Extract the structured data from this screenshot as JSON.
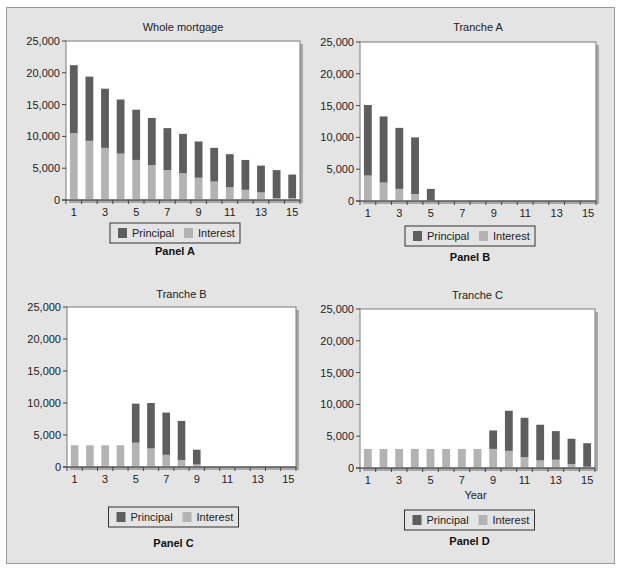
{
  "colors": {
    "principal": "#5e5e5e",
    "interest": "#b3b3b3",
    "plot_bg": "#ffffff",
    "frame_bg": "#e4e4e4"
  },
  "legend": {
    "principal": "Principal",
    "interest": "Interest"
  },
  "chart_data": [
    {
      "type": "bar",
      "stacked": true,
      "title": "Whole mortgage",
      "panel": "Panel A",
      "xlabel": "",
      "ylabel": "",
      "ylim": [
        0,
        25000
      ],
      "yticks": [
        "0",
        "5,000",
        "10,000",
        "15,000",
        "20,000",
        "25,000"
      ],
      "xticks": [
        "1",
        "3",
        "5",
        "7",
        "9",
        "11",
        "13",
        "15"
      ],
      "categories": [
        1,
        2,
        3,
        4,
        5,
        6,
        7,
        8,
        9,
        10,
        11,
        12,
        13,
        14,
        15
      ],
      "legend_position": "bottom",
      "series": [
        {
          "name": "Interest",
          "values": [
            10500,
            9300,
            8200,
            7300,
            6300,
            5500,
            4700,
            4200,
            3500,
            2900,
            2000,
            1600,
            1200,
            300,
            300
          ]
        },
        {
          "name": "Principal",
          "values": [
            10700,
            10100,
            9300,
            8500,
            7900,
            7400,
            6600,
            6200,
            5700,
            5300,
            5200,
            4700,
            4200,
            4400,
            3700
          ]
        }
      ]
    },
    {
      "type": "bar",
      "stacked": true,
      "title": "Tranche A",
      "panel": "Panel B",
      "xlabel": "",
      "ylabel": "",
      "ylim": [
        0,
        25000
      ],
      "yticks": [
        "0",
        "5,000",
        "10,000",
        "15,000",
        "20,000",
        "25,000"
      ],
      "xticks": [
        "1",
        "3",
        "5",
        "7",
        "9",
        "11",
        "13",
        "15"
      ],
      "categories": [
        1,
        2,
        3,
        4,
        5,
        6,
        7,
        8,
        9,
        10,
        11,
        12,
        13,
        14,
        15
      ],
      "legend_position": "bottom",
      "series": [
        {
          "name": "Interest",
          "values": [
            4000,
            2900,
            1900,
            1100,
            100,
            0,
            0,
            0,
            0,
            0,
            0,
            0,
            0,
            0,
            0
          ]
        },
        {
          "name": "Principal",
          "values": [
            11100,
            10400,
            9600,
            8900,
            1800,
            0,
            0,
            0,
            0,
            0,
            0,
            0,
            0,
            0,
            0
          ]
        }
      ]
    },
    {
      "type": "bar",
      "stacked": true,
      "title": "Tranche B",
      "panel": "Panel C",
      "xlabel": "",
      "ylabel": "",
      "ylim": [
        0,
        25000
      ],
      "yticks": [
        "0",
        "5,000",
        "10,000",
        "15,000",
        "20,000",
        "25,000"
      ],
      "xticks": [
        "1",
        "3",
        "5",
        "7",
        "9",
        "11",
        "13",
        "15"
      ],
      "categories": [
        1,
        2,
        3,
        4,
        5,
        6,
        7,
        8,
        9,
        10,
        11,
        12,
        13,
        14,
        15
      ],
      "legend_position": "bottom",
      "series": [
        {
          "name": "Interest",
          "values": [
            3400,
            3400,
            3400,
            3400,
            3800,
            2900,
            1900,
            1100,
            400,
            0,
            0,
            0,
            0,
            0,
            0
          ]
        },
        {
          "name": "Principal",
          "values": [
            0,
            0,
            0,
            0,
            6100,
            7100,
            6600,
            6100,
            2300,
            0,
            0,
            0,
            0,
            0,
            0
          ]
        }
      ]
    },
    {
      "type": "bar",
      "stacked": true,
      "title": "Tranche C",
      "panel": "Panel D",
      "xlabel": "Year",
      "ylabel": "",
      "ylim": [
        0,
        25000
      ],
      "yticks": [
        "0",
        "5,000",
        "10,000",
        "15,000",
        "20,000",
        "25,000"
      ],
      "xticks": [
        "1",
        "3",
        "5",
        "7",
        "9",
        "11",
        "13",
        "15"
      ],
      "categories": [
        1,
        2,
        3,
        4,
        5,
        6,
        7,
        8,
        9,
        10,
        11,
        12,
        13,
        14,
        15
      ],
      "legend_position": "bottom",
      "series": [
        {
          "name": "Interest",
          "values": [
            3000,
            3000,
            3000,
            3000,
            3000,
            3000,
            3000,
            3000,
            3000,
            2700,
            1700,
            1200,
            1300,
            600,
            200
          ]
        },
        {
          "name": "Principal",
          "values": [
            0,
            0,
            0,
            0,
            0,
            0,
            0,
            0,
            2900,
            6300,
            6200,
            5600,
            4500,
            4000,
            3700
          ]
        }
      ]
    }
  ]
}
